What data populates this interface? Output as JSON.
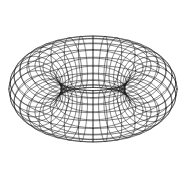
{
  "figure": {
    "kind": "wireframe-torus",
    "width": 187,
    "height": 180,
    "background_color": "#ffffff",
    "line_color": "#1a1a1a",
    "line_width": 0.55,
    "has_text": false,
    "has_axes": false,
    "has_legend": false
  },
  "chart_data": {
    "type": "line",
    "subtitle": "",
    "xlabel": "",
    "ylabel": "",
    "grid": true,
    "legend": "none",
    "xlim": [
      0,
      187
    ],
    "ylim": [
      0,
      180
    ],
    "surface": "torus",
    "parameters": {
      "major_radius_R": 58,
      "minor_radius_r": 26,
      "center_x": 93,
      "center_y": 89,
      "tilt_deg": 62,
      "spin_deg": 0,
      "meridian_count": 36,
      "parallel_count": 20,
      "samples_per_curve": 180
    },
    "outer_silhouette": {
      "shape": "circle",
      "x_range": [
        14,
        172
      ],
      "y_range": [
        10,
        168
      ],
      "center": [
        93,
        89
      ],
      "radius": 79
    },
    "inner_hole": {
      "shape": "ellipse",
      "x_range": [
        27,
        103
      ],
      "y_range": [
        48,
        128
      ],
      "center": [
        65,
        88
      ],
      "radius_x": 38,
      "radius_y": 40,
      "fill": "#ffffff"
    },
    "density_notes": {
      "right_side": "open grid cells, mesh clearly resolved",
      "upper_left": "arcs bunch into a thin dark crescent",
      "lower_left": "arcs bunch into a thin dark crescent"
    },
    "series": [
      {
        "name": "meridian-circles",
        "count": 36,
        "values": []
      },
      {
        "name": "parallel-circles",
        "count": 20,
        "values": []
      }
    ]
  }
}
